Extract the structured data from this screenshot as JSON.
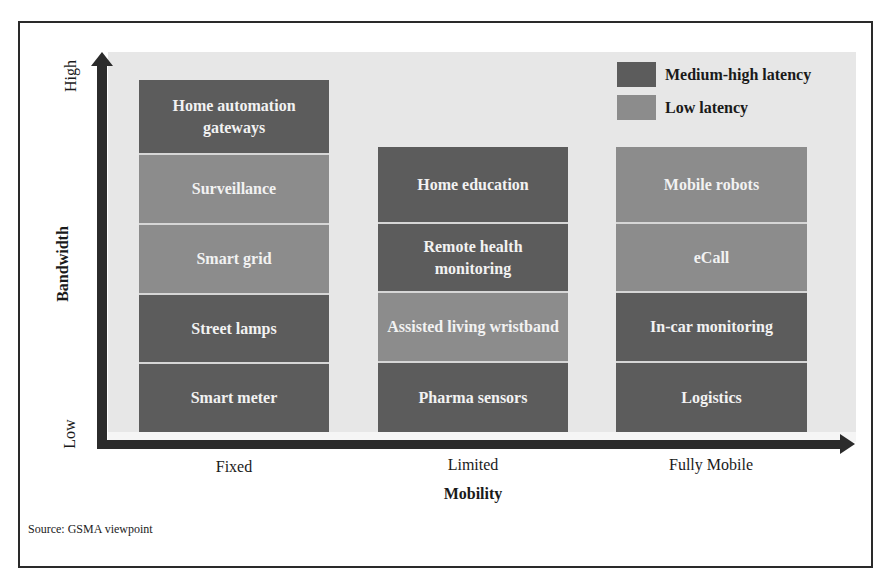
{
  "legend": {
    "items": [
      {
        "label": "Medium-high latency",
        "color": "#5c5c5c",
        "kind": "dark"
      },
      {
        "label": "Low latency",
        "color": "#8c8c8c",
        "kind": "light"
      }
    ]
  },
  "y_axis": {
    "title": "Bandwidth",
    "high_label": "High",
    "low_label": "Low"
  },
  "x_axis": {
    "title": "Mobility",
    "categories": [
      "Fixed",
      "Limited",
      "Fully Mobile"
    ]
  },
  "columns": [
    {
      "category": "Fixed",
      "cells_top_to_bottom": [
        {
          "label": "Home automation gateways",
          "latency": "Medium-high latency"
        },
        {
          "label": "Surveillance",
          "latency": "Low latency"
        },
        {
          "label": "Smart grid",
          "latency": "Low latency"
        },
        {
          "label": "Street lamps",
          "latency": "Medium-high latency"
        },
        {
          "label": "Smart meter",
          "latency": "Medium-high latency"
        }
      ]
    },
    {
      "category": "Limited",
      "cells_top_to_bottom": [
        {
          "label": "Home education",
          "latency": "Medium-high latency"
        },
        {
          "label": "Remote health monitoring",
          "latency": "Medium-high latency"
        },
        {
          "label": "Assisted living wristband",
          "latency": "Low latency"
        },
        {
          "label": "Pharma sensors",
          "latency": "Medium-high latency"
        }
      ]
    },
    {
      "category": "Fully Mobile",
      "cells_top_to_bottom": [
        {
          "label": "Mobile robots",
          "latency": "Low latency"
        },
        {
          "label": "eCall",
          "latency": "Low latency"
        },
        {
          "label": "In-car monitoring",
          "latency": "Medium-high latency"
        },
        {
          "label": "Logistics",
          "latency": "Medium-high latency"
        }
      ]
    }
  ],
  "source": "Source: GSMA viewpoint",
  "colors": {
    "medium_high_latency": "#5c5c5c",
    "low_latency": "#8c8c8c",
    "plot_background": "#e7e7e7",
    "axis": "#2b2b2b"
  }
}
